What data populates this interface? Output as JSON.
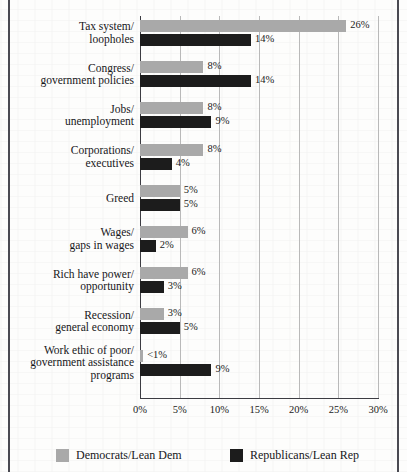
{
  "chart_data": {
    "type": "bar",
    "orientation": "horizontal",
    "grouped": true,
    "title": "",
    "subtitle": "",
    "xlabel": "",
    "ylabel": "",
    "xlim": [
      0,
      30
    ],
    "xunit": "%",
    "grid": true,
    "legend_position": "bottom",
    "xticks": [
      "0%",
      "5%",
      "10%",
      "15%",
      "20%",
      "25%",
      "30%"
    ],
    "xtick_values": [
      0,
      5,
      10,
      15,
      20,
      25,
      30
    ],
    "categories": [
      "Tax system/\nloopholes",
      "Congress/\ngovernment policies",
      "Jobs/\nunemployment",
      "Corporations/\nexecutives",
      "Greed",
      "Wages/\ngaps in wages",
      "Rich have power/\nopportunity",
      "Recession/\ngeneral economy",
      "Work ethic of poor/\ngovernment assistance\nprograms"
    ],
    "series": [
      {
        "name": "Democrats/Lean Dem",
        "color": "#a9a9a9",
        "values": [
          26,
          8,
          8,
          8,
          5,
          6,
          6,
          3,
          0.4
        ],
        "labels": [
          "26%",
          "8%",
          "8%",
          "8%",
          "5%",
          "6%",
          "6%",
          "3%",
          "<1%"
        ]
      },
      {
        "name": "Republicans/Lean Rep",
        "color": "#1c1c1c",
        "values": [
          14,
          14,
          9,
          4,
          5,
          2,
          3,
          5,
          9
        ],
        "labels": [
          "14%",
          "14%",
          "9%",
          "4%",
          "5%",
          "2%",
          "3%",
          "5%",
          "9%"
        ]
      }
    ]
  },
  "legend": {
    "items": [
      {
        "label": "Democrats/Lean Dem",
        "swatch": "dem-swatch"
      },
      {
        "label": "Republicans/Lean Rep",
        "swatch": "rep-swatch"
      }
    ]
  },
  "rows": [
    {
      "line1": "Tax system/",
      "line2": "loopholes",
      "line3": ""
    },
    {
      "line1": "Congress/",
      "line2": "government policies",
      "line3": ""
    },
    {
      "line1": "Jobs/",
      "line2": "unemployment",
      "line3": ""
    },
    {
      "line1": "Corporations/",
      "line2": "executives",
      "line3": ""
    },
    {
      "line1": "Greed",
      "line2": "",
      "line3": ""
    },
    {
      "line1": "Wages/",
      "line2": "gaps in wages",
      "line3": ""
    },
    {
      "line1": "Rich have power/",
      "line2": "opportunity",
      "line3": ""
    },
    {
      "line1": "Recession/",
      "line2": "general economy",
      "line3": ""
    },
    {
      "line1": "Work ethic of poor/",
      "line2": "government assistance",
      "line3": "programs"
    }
  ]
}
